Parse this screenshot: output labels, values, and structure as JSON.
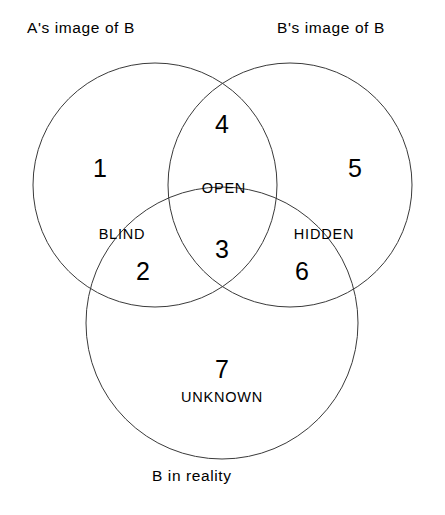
{
  "diagram": {
    "type": "venn",
    "circle_count": 3,
    "sets": [
      {
        "id": "a-image-of-b",
        "label": "A's image of B",
        "cx": 155,
        "cy": 185,
        "r": 122
      },
      {
        "id": "b-image-of-b",
        "label": "B's image of B",
        "cx": 290,
        "cy": 185,
        "r": 122
      },
      {
        "id": "b-in-reality",
        "label": "B in reality",
        "cx": 222,
        "cy": 323,
        "r": 136
      }
    ],
    "regions": [
      {
        "number": "1",
        "name": "",
        "x": 100,
        "y": 168
      },
      {
        "number": "2",
        "name": "",
        "x": 143,
        "y": 271
      },
      {
        "number": "3",
        "name": "",
        "x": 222,
        "y": 249
      },
      {
        "number": "4",
        "name": "",
        "x": 222,
        "y": 124
      },
      {
        "number": "5",
        "name": "",
        "x": 355,
        "y": 168
      },
      {
        "number": "6",
        "name": "",
        "x": 302,
        "y": 271
      },
      {
        "number": "7",
        "name": "UNKNOWN",
        "x": 222,
        "y": 369
      }
    ],
    "region_names": [
      {
        "id": "open",
        "text": "OPEN",
        "x": 224,
        "y": 188
      },
      {
        "id": "blind",
        "text": "BLIND",
        "x": 122,
        "y": 234
      },
      {
        "id": "hidden",
        "text": "HIDDEN",
        "x": 324,
        "y": 234
      },
      {
        "id": "unknown",
        "text": "UNKNOWN",
        "x": 222,
        "y": 397
      }
    ],
    "colors": {
      "background": "#ffffff",
      "stroke": "#3a3a3a",
      "text": "#000000"
    }
  }
}
